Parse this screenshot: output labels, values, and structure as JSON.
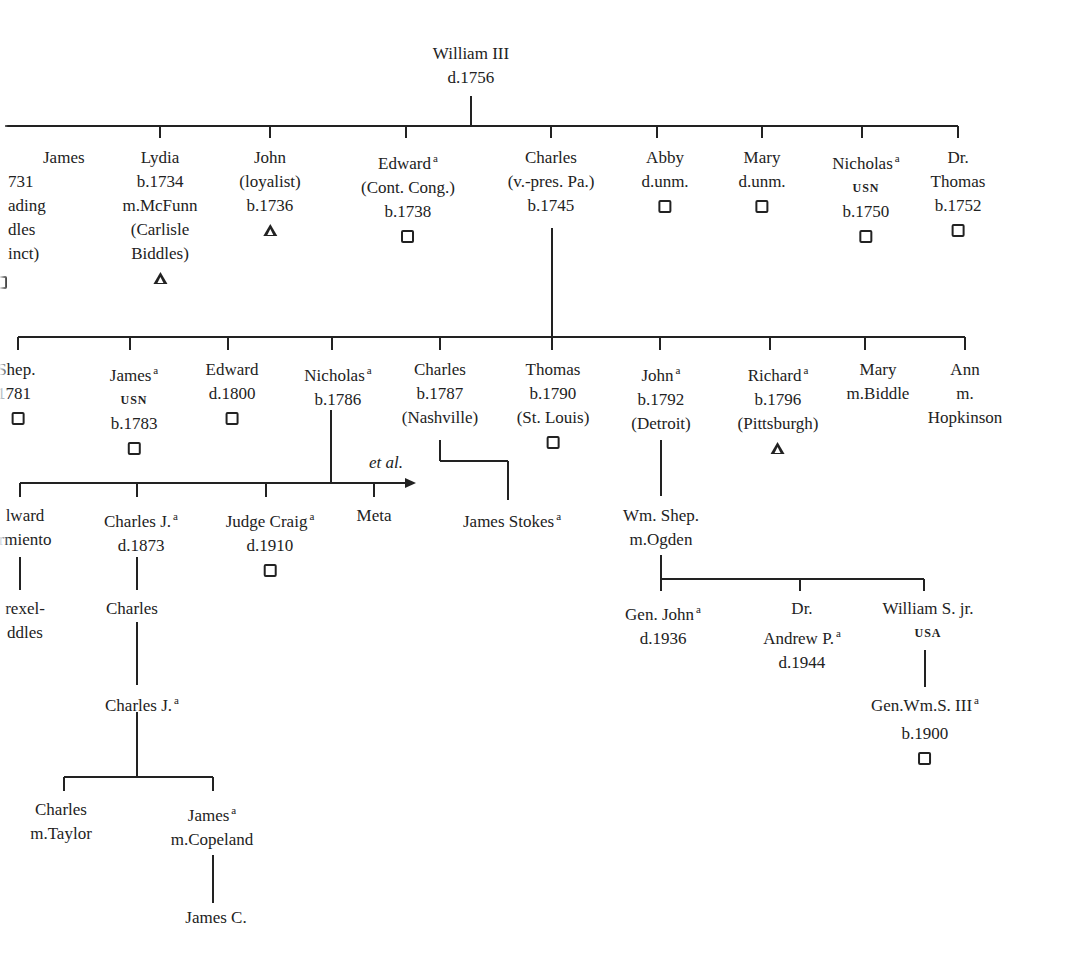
{
  "root": {
    "name": "William III",
    "lines": [
      "d.1756"
    ]
  },
  "generation1": [
    {
      "name": "James",
      "lines": [
        "731",
        "ading",
        "dles",
        "inct)"
      ],
      "symbol": "square",
      "clipped": true
    },
    {
      "name": "Lydia",
      "lines": [
        "b.1734",
        "m.McFunn",
        "(Carlisle",
        "Biddles)"
      ],
      "symbol": "triangle"
    },
    {
      "name": "John",
      "lines": [
        "(loyalist)",
        "b.1736"
      ],
      "symbol": "triangle"
    },
    {
      "name": "Edward",
      "sup": "a",
      "lines": [
        "(Cont. Cong.)",
        "b.1738"
      ],
      "symbol": "square"
    },
    {
      "name": "Charles",
      "lines": [
        "(v.-pres. Pa.)",
        "b.1745"
      ]
    },
    {
      "name": "Abby",
      "lines": [
        "d.unm."
      ],
      "symbol": "square"
    },
    {
      "name": "Mary",
      "lines": [
        "d.unm."
      ],
      "symbol": "square"
    },
    {
      "name": "Nicholas",
      "sup": "a",
      "smallcaps": "USN",
      "lines": [
        "b.1750"
      ],
      "symbol": "square"
    },
    {
      "name": "Dr.",
      "lines": [
        "Thomas",
        "b.1752"
      ],
      "symbol": "square"
    }
  ],
  "generation2": [
    {
      "name": ". Shep.",
      "lines": [
        "1781"
      ],
      "symbol": "square",
      "clipped": true
    },
    {
      "name": "James",
      "sup": "a",
      "smallcaps": "USN",
      "lines": [
        "b.1783"
      ],
      "symbol": "square"
    },
    {
      "name": "Edward",
      "lines": [
        "d.1800"
      ],
      "symbol": "square"
    },
    {
      "name": "Nicholas",
      "sup": "a",
      "lines": [
        "b.1786"
      ]
    },
    {
      "name": "Charles",
      "lines": [
        "b.1787",
        "(Nashville)"
      ]
    },
    {
      "name": "Thomas",
      "lines": [
        "b.1790",
        "(St. Louis)"
      ],
      "symbol": "square"
    },
    {
      "name": "John",
      "sup": "a",
      "lines": [
        "b.1792",
        "(Detroit)"
      ]
    },
    {
      "name": "Richard",
      "sup": "a",
      "lines": [
        "b.1796",
        "(Pittsburgh)"
      ],
      "symbol": "triangle"
    },
    {
      "name": "Mary",
      "lines": [
        "m.Biddle"
      ]
    },
    {
      "name": "Ann",
      "lines": [
        "m.",
        "Hopkinson"
      ]
    }
  ],
  "generation3": {
    "et_al_label": "et al.",
    "nicholas_children": [
      {
        "name": "lward",
        "lines": [
          "rmiento"
        ],
        "clipped": true
      },
      {
        "name": "Charles J.",
        "sup": "a",
        "lines": [
          "d.1873"
        ]
      },
      {
        "name": "Judge Craig",
        "sup": "a",
        "lines": [
          "d.1910"
        ],
        "symbol": "square"
      },
      {
        "name": "Meta",
        "lines": []
      }
    ],
    "charles_child": {
      "name": "James Stokes",
      "sup": "a",
      "lines": []
    },
    "john_child": {
      "name": "Wm. Shep.",
      "lines": [
        "m.Ogden"
      ]
    }
  },
  "generation4": {
    "edward_line": {
      "name": "rexel-",
      "lines": [
        "ddles"
      ],
      "clipped": true
    },
    "charles_j_child": {
      "name": "Charles",
      "lines": []
    },
    "wm_shep_children": [
      {
        "name": "Gen. John",
        "sup": "a",
        "lines": [
          "d.1936"
        ]
      },
      {
        "name": "Dr.",
        "lines": [],
        "name2": "Andrew P.",
        "sup2": "a",
        "lines2": [
          "d.1944"
        ]
      },
      {
        "name": "William S. jr.",
        "smallcaps": "USA",
        "lines": []
      }
    ]
  },
  "generation5": {
    "charles_j2": {
      "name": "Charles J.",
      "sup": "a"
    },
    "gen_wm_s_iii": {
      "name": "Gen.Wm.S. III",
      "sup": "a",
      "lines": [
        "b.1900"
      ],
      "symbol": "square"
    }
  },
  "generation6": [
    {
      "name": "Charles",
      "lines": [
        "m.Taylor"
      ]
    },
    {
      "name": "James",
      "sup": "a",
      "lines": [
        "m.Copeland"
      ]
    }
  ],
  "generation7": {
    "name": "James C."
  },
  "colors": {
    "ink": "#222222",
    "paper": "#ffffff"
  }
}
